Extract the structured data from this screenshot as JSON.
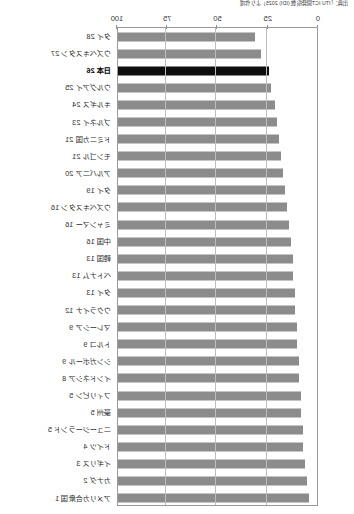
{
  "chart_data": {
    "type": "bar",
    "orientation": "horizontal-mirrored",
    "title": "",
    "source_note": "出典：「ITU ICT開発指数 (IDI) 2025」より作成",
    "xlabel": "",
    "ylabel": "",
    "xlim": [
      0,
      100
    ],
    "xticks": [
      100,
      75,
      50,
      25,
      0
    ],
    "xtick_labels": [
      "100",
      "75",
      "50",
      "25",
      "0"
    ],
    "grid": true,
    "axis_direction": "right-to-left",
    "legend": "none",
    "highlight_color": "#0e0e0e",
    "bar_color": "#8c8c8c",
    "highlight_category": "日本 26",
    "categories": [
      "タイ 28",
      "ウズベキスタン 27",
      "日本 26",
      "ウルグアイ 25",
      "キルギス 24",
      "ブルネイ 23",
      "ドミニカ国 21",
      "モンゴル 21",
      "アルバニア 20",
      "タイ 19",
      "ウズベキスタン 16",
      "ミャンマー 16",
      "中国 16",
      "韓国 13",
      "ベトナム 13",
      "タイ 13",
      "ウクライナ 12",
      "マレーシア 9",
      "トルコ 9",
      "シンガポール 9",
      "インドネシア 8",
      "フィリピン 5",
      "豪州 5",
      "ニュージーランド 5",
      "ドイツ 4",
      "イギリス 3",
      "カナダ 2",
      "アメリカ合衆国 1"
    ],
    "values": [
      68,
      71,
      75,
      76,
      78,
      79,
      80,
      81,
      82,
      83,
      84,
      85,
      86,
      87,
      87,
      88,
      88,
      89,
      89,
      90,
      90,
      91,
      91,
      92,
      92,
      93,
      94,
      95
    ]
  }
}
